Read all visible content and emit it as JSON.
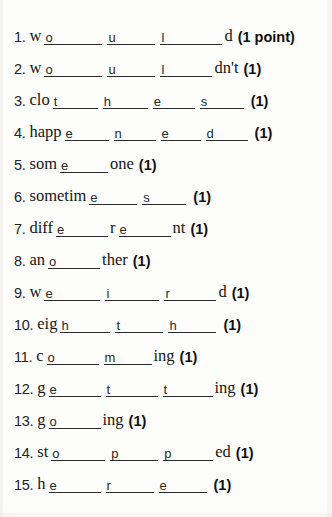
{
  "worksheet": {
    "title": "Spelling fill-in-the-blank worksheet",
    "point_label_full": "(1 point)",
    "point_label_short": "(1)",
    "questions": [
      {
        "number": "1.",
        "prefix": "w",
        "blanks": [
          "o",
          "u",
          "l"
        ],
        "blank_widths": [
          58,
          48,
          62
        ],
        "suffix": "d",
        "points": "(1 point)",
        "answer_word": "would"
      },
      {
        "number": "2.",
        "prefix": "w",
        "blanks": [
          "o",
          "u",
          "l"
        ],
        "blank_widths": [
          58,
          48,
          52
        ],
        "suffix": "dn't",
        "points": "(1)",
        "answer_word": "wouldn't"
      },
      {
        "number": "3.",
        "prefix": "clo",
        "blanks": [
          "t",
          "h",
          "e",
          "s"
        ],
        "blank_widths": [
          45,
          45,
          42,
          44
        ],
        "suffix": "",
        "points": "(1)",
        "answer_word": "clothes"
      },
      {
        "number": "4.",
        "prefix": "happ",
        "blanks": [
          "e",
          "n",
          "e",
          "d"
        ],
        "blank_widths": [
          44,
          42,
          40,
          42
        ],
        "suffix": "",
        "points": "(1)",
        "answer_word": "happened"
      },
      {
        "number": "5.",
        "prefix": "som",
        "blanks": [
          "e"
        ],
        "blank_widths": [
          48
        ],
        "suffix": "one",
        "points": "(1)",
        "answer_word": "someone"
      },
      {
        "number": "6.",
        "prefix": "sometim",
        "blanks": [
          "e",
          "s"
        ],
        "blank_widths": [
          48,
          44
        ],
        "suffix": "",
        "points": "(1)",
        "answer_word": "sometimes"
      },
      {
        "number": "7.",
        "prefix": "diff",
        "blanks": [
          "e"
        ],
        "blank_widths": [
          52
        ],
        "mid": "r",
        "blanks2": [
          "e"
        ],
        "blank_widths2": [
          52
        ],
        "suffix": "nt",
        "points": "(1)",
        "answer_word": "different"
      },
      {
        "number": "8.",
        "prefix": "an",
        "blanks": [
          "o"
        ],
        "blank_widths": [
          52
        ],
        "suffix": "ther",
        "points": "(1)",
        "answer_word": "another"
      },
      {
        "number": "9.",
        "prefix": "w",
        "blanks": [
          "e",
          "i",
          "r"
        ],
        "blank_widths": [
          56,
          54,
          52
        ],
        "suffix": "d",
        "points": "(1)",
        "answer_word": "weird"
      },
      {
        "number": "10.",
        "prefix": "eig",
        "blanks": [
          "h",
          "t",
          "h"
        ],
        "blank_widths": [
          50,
          48,
          48
        ],
        "suffix": "",
        "points": "(1)",
        "answer_word": "eighth"
      },
      {
        "number": "11.",
        "prefix": "c",
        "blanks": [
          "o",
          "m"
        ],
        "blank_widths": [
          52,
          48
        ],
        "suffix": "ing",
        "points": "(1)",
        "answer_word": "coming"
      },
      {
        "number": "12.",
        "prefix": "g",
        "blanks": [
          "e",
          "t",
          "t"
        ],
        "blank_widths": [
          52,
          52,
          50
        ],
        "suffix": "ing",
        "points": "(1)",
        "answer_word": "getting"
      },
      {
        "number": "13.",
        "prefix": "g",
        "blanks": [
          "o"
        ],
        "blank_widths": [
          52
        ],
        "suffix": "ing",
        "points": "(1)",
        "answer_word": "going"
      },
      {
        "number": "14.",
        "prefix": "st",
        "blanks": [
          "o",
          "p",
          "p"
        ],
        "blank_widths": [
          54,
          48,
          50
        ],
        "suffix": "ed",
        "points": "(1)",
        "answer_word": "stopped"
      },
      {
        "number": "15.",
        "prefix": "h",
        "blanks": [
          "e",
          "r",
          "e"
        ],
        "blank_widths": [
          52,
          48,
          48
        ],
        "suffix": "",
        "points": "(1)",
        "answer_word": "here"
      }
    ]
  }
}
